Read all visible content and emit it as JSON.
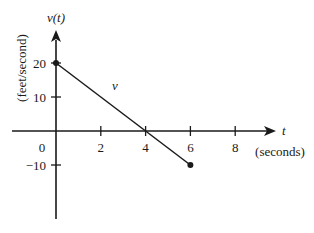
{
  "chart_data": {
    "type": "line",
    "title": "",
    "xlabel": "t",
    "xlabel_units": "(seconds)",
    "ylabel": "v(t)",
    "ylabel_units": "(feet/second)",
    "series_label": "v",
    "x_ticks": [
      0,
      2,
      4,
      6,
      8
    ],
    "x_tick_labels": [
      "0",
      "2",
      "4",
      "6",
      "8"
    ],
    "y_ticks": [
      20,
      10,
      -10
    ],
    "y_tick_labels": [
      "20",
      "10",
      "−10"
    ],
    "xlim": [
      -2,
      10
    ],
    "ylim": [
      -26,
      32
    ],
    "grid": false,
    "legend": "none",
    "series": [
      {
        "name": "v",
        "x": [
          0,
          6
        ],
        "y": [
          20,
          -10
        ],
        "start_marker": "filled-dot",
        "end_marker": "filled-dot"
      }
    ]
  },
  "colors": {
    "ink": "#1a1a1a",
    "background": "#ffffff"
  }
}
